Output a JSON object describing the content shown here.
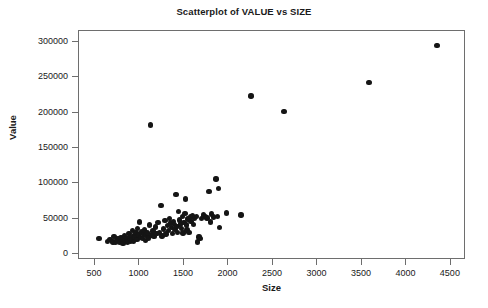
{
  "chart_data": {
    "type": "scatter",
    "title": "Scatterplot of VALUE vs SIZE",
    "xlabel": "Size",
    "ylabel": "Value",
    "xlim": [
      320,
      4670
    ],
    "ylim": [
      -8000,
      315000
    ],
    "xticks": [
      500,
      1000,
      1500,
      2000,
      2500,
      3000,
      3500,
      4000,
      4500
    ],
    "xtick_labels": [
      "500",
      "1000",
      "1500",
      "2000",
      "2500",
      "3000",
      "3500",
      "4000",
      "4500"
    ],
    "yticks": [
      0,
      50000,
      100000,
      150000,
      200000,
      250000,
      300000
    ],
    "ytick_labels": [
      "0",
      "50000",
      "100000",
      "150000",
      "200000",
      "250000",
      "300000"
    ],
    "grid": false,
    "legend": null,
    "marker": "filled-circle",
    "marker_color": "#151515",
    "n_points": 103,
    "series": [
      {
        "name": "VALUE vs SIZE",
        "points": [
          [
            545,
            22000
          ],
          [
            640,
            18500
          ],
          [
            670,
            20500
          ],
          [
            700,
            17500
          ],
          [
            715,
            25500
          ],
          [
            730,
            16500
          ],
          [
            745,
            19500
          ],
          [
            760,
            21500
          ],
          [
            775,
            17000
          ],
          [
            790,
            23000
          ],
          [
            800,
            18000
          ],
          [
            815,
            15500
          ],
          [
            830,
            26500
          ],
          [
            840,
            20000
          ],
          [
            855,
            22500
          ],
          [
            865,
            17500
          ],
          [
            880,
            29500
          ],
          [
            890,
            24500
          ],
          [
            900,
            19000
          ],
          [
            910,
            21000
          ],
          [
            920,
            33500
          ],
          [
            930,
            18500
          ],
          [
            940,
            26000
          ],
          [
            950,
            23500
          ],
          [
            960,
            30500
          ],
          [
            970,
            20500
          ],
          [
            980,
            36500
          ],
          [
            990,
            27500
          ],
          [
            1000,
            45500
          ],
          [
            1010,
            24000
          ],
          [
            1020,
            31500
          ],
          [
            1035,
            22000
          ],
          [
            1045,
            28500
          ],
          [
            1055,
            34500
          ],
          [
            1065,
            19500
          ],
          [
            1075,
            26500
          ],
          [
            1090,
            30000
          ],
          [
            1100,
            23000
          ],
          [
            1115,
            41500
          ],
          [
            1125,
            182500
          ],
          [
            1140,
            27000
          ],
          [
            1150,
            33000
          ],
          [
            1165,
            25000
          ],
          [
            1180,
            38500
          ],
          [
            1195,
            29000
          ],
          [
            1210,
            44500
          ],
          [
            1225,
            31000
          ],
          [
            1240,
            68500
          ],
          [
            1255,
            26000
          ],
          [
            1270,
            35500
          ],
          [
            1285,
            47500
          ],
          [
            1300,
            28500
          ],
          [
            1315,
            41000
          ],
          [
            1325,
            33500
          ],
          [
            1340,
            50500
          ],
          [
            1350,
            44000
          ],
          [
            1360,
            37500
          ],
          [
            1370,
            29500
          ],
          [
            1380,
            46500
          ],
          [
            1390,
            42000
          ],
          [
            1400,
            35000
          ],
          [
            1410,
            84500
          ],
          [
            1420,
            39500
          ],
          [
            1430,
            31000
          ],
          [
            1440,
            60500
          ],
          [
            1450,
            48500
          ],
          [
            1460,
            43000
          ],
          [
            1470,
            36500
          ],
          [
            1480,
            53500
          ],
          [
            1490,
            30000
          ],
          [
            1500,
            45000
          ],
          [
            1510,
            57500
          ],
          [
            1515,
            78000
          ],
          [
            1525,
            41500
          ],
          [
            1535,
            34500
          ],
          [
            1545,
            50000
          ],
          [
            1555,
            30500
          ],
          [
            1570,
            52500
          ],
          [
            1580,
            46000
          ],
          [
            1595,
            54500
          ],
          [
            1605,
            42500
          ],
          [
            1620,
            51500
          ],
          [
            1640,
            53000
          ],
          [
            1655,
            17500
          ],
          [
            1670,
            24500
          ],
          [
            1680,
            22500
          ],
          [
            1700,
            50500
          ],
          [
            1720,
            55500
          ],
          [
            1745,
            53500
          ],
          [
            1760,
            51000
          ],
          [
            1780,
            88500
          ],
          [
            1795,
            45500
          ],
          [
            1810,
            57000
          ],
          [
            1830,
            52500
          ],
          [
            1860,
            106500
          ],
          [
            1875,
            53000
          ],
          [
            1890,
            92500
          ],
          [
            1900,
            38000
          ],
          [
            1975,
            58500
          ],
          [
            2140,
            55500
          ],
          [
            2255,
            223500
          ],
          [
            2625,
            201500
          ],
          [
            3580,
            242000
          ],
          [
            4345,
            294500
          ]
        ]
      }
    ]
  },
  "chart_meta": {
    "title": "Scatterplot of VALUE vs SIZE",
    "xlabel": "Size",
    "ylabel": "Value"
  }
}
